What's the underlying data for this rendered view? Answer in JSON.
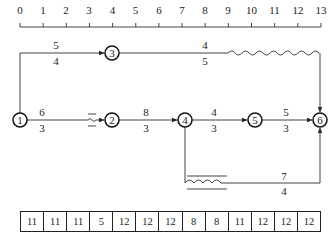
{
  "timeline": {
    "ticks": [
      "0",
      "1",
      "2",
      "3",
      "4",
      "5",
      "6",
      "7",
      "8",
      "9",
      "10",
      "11",
      "12",
      "13"
    ]
  },
  "nodes": [
    {
      "id": "1",
      "label": "1"
    },
    {
      "id": "2",
      "label": "2"
    },
    {
      "id": "3",
      "label": "3"
    },
    {
      "id": "4",
      "label": "4"
    },
    {
      "id": "5",
      "label": "5"
    },
    {
      "id": "6",
      "label": "6"
    }
  ],
  "activities": [
    {
      "from": "1",
      "to": "3",
      "resource": "5",
      "duration": "4"
    },
    {
      "from": "3",
      "to": "6",
      "resource": "4",
      "duration": "5"
    },
    {
      "from": "1",
      "to": "2",
      "resource": "6",
      "duration": "3"
    },
    {
      "from": "2",
      "to": "4",
      "resource": "8",
      "duration": "3"
    },
    {
      "from": "4",
      "to": "5",
      "resource": "4",
      "duration": "3"
    },
    {
      "from": "5",
      "to": "6",
      "resource": "5",
      "duration": "3"
    },
    {
      "from": "4",
      "to": "6",
      "resource": "7",
      "duration": "4"
    }
  ],
  "resource_table": {
    "values": [
      "11",
      "11",
      "11",
      "5",
      "12",
      "12",
      "12",
      "8",
      "8",
      "11",
      "12",
      "12",
      "12"
    ]
  }
}
